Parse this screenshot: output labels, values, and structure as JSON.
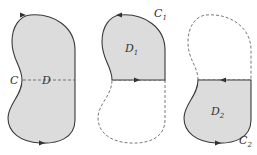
{
  "diagram": {
    "type": "region decomposition",
    "colors": {
      "fill": "#dcdcdc",
      "stroke": "#3a3a3a",
      "dashed": "#6a6a6a",
      "background": "#ffffff"
    },
    "panels": [
      {
        "id": "whole",
        "curve_label": "C",
        "region_label": "D",
        "description": "Full bean-shaped region D bounded by curve C, with dashed horizontal split line"
      },
      {
        "id": "upper",
        "curve_label": "C",
        "curve_sub": "1",
        "region_label": "D",
        "region_sub": "1",
        "description": "Upper half D1 bounded by C1; split segment oriented left-to-right"
      },
      {
        "id": "lower",
        "curve_label": "C",
        "curve_sub": "2",
        "region_label": "D",
        "region_sub": "2",
        "description": "Lower half D2 bounded by C2; split segment oriented right-to-left"
      }
    ]
  }
}
